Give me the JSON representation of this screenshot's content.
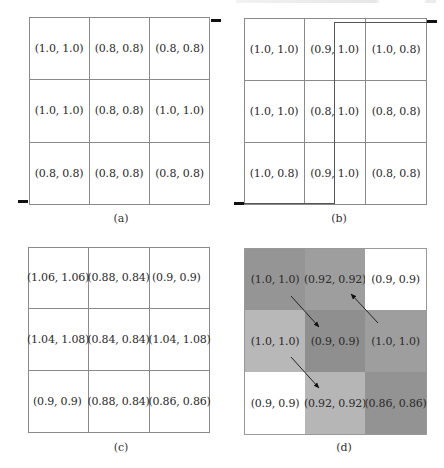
{
  "figure": {
    "panels": [
      {
        "id": "a",
        "caption": "(a)",
        "rows": [
          [
            "(1.0, 1.0)",
            "(0.8, 0.8)",
            "(0.8, 0.8)"
          ],
          [
            "(1.0, 1.0)",
            "(0.8, 0.8)",
            "(1.0, 1.0)"
          ],
          [
            "(0.8, 0.8)",
            "(0.8, 0.8)",
            "(0.8, 0.8)"
          ]
        ],
        "markers": [
          "start-bottom-left",
          "end-top-right"
        ]
      },
      {
        "id": "b",
        "caption": "(b)",
        "rows": [
          [
            "(1.0, 1.0)",
            "(0.9, 1.0)",
            "(1.0, 0.8)"
          ],
          [
            "(1.0, 1.0)",
            "(0.8, 1.0)",
            "(0.8, 0.8)"
          ],
          [
            "(1.0, 0.8)",
            "(0.9, 1.0)",
            "(0.8, 0.8)"
          ]
        ],
        "markers": [
          "start-bottom-left",
          "end-top-right"
        ],
        "path": "bottom-left → along bottom edge → up through middle column → along top edge → top-right"
      },
      {
        "id": "c",
        "caption": "(c)",
        "rows": [
          [
            "(1.06, 1.06)",
            "(0.88, 0.84)",
            "(0.9, 0.9)"
          ],
          [
            "(1.04, 1.08)",
            "(0.84, 0.84)",
            "(1.04, 1.08)"
          ],
          [
            "(0.9, 0.9)",
            "(0.88, 0.84)",
            "(0.86, 0.86)"
          ]
        ]
      },
      {
        "id": "d",
        "caption": "(d)",
        "rows": [
          [
            "(1.0, 1.0)",
            "(0.92, 0.92)",
            "(0.9, 0.9)"
          ],
          [
            "(1.0, 1.0)",
            "(0.9, 0.9)",
            "(1.0, 1.0)"
          ],
          [
            "(0.9, 0.9)",
            "(0.92, 0.92)",
            "(0.86, 0.86)"
          ]
        ],
        "shading": [
          [
            "#a2a2a2",
            "#acacac",
            "#ffffff"
          ],
          [
            "#c9c9c9",
            "#9c9c9c",
            "#acacac"
          ],
          [
            "#ffffff",
            "#c6c6c6",
            "#a0a0a0"
          ]
        ],
        "arrows": [
          {
            "from": "row0-col0",
            "to": "row1-col1"
          },
          {
            "from": "row1-col2",
            "to": "row0-col1"
          },
          {
            "from": "row1-col0",
            "to": "row2-col1"
          }
        ]
      }
    ]
  }
}
